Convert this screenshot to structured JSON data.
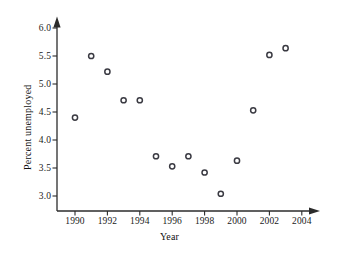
{
  "chart_data": {
    "type": "scatter",
    "title": "",
    "xlabel": "Year",
    "ylabel": "Percent unemployed",
    "x": [
      1990,
      1991,
      1992,
      1993,
      1994,
      1995,
      1996,
      1997,
      1998,
      1999,
      2000,
      2001,
      2002,
      2003
    ],
    "values": [
      4.4,
      5.5,
      5.22,
      4.71,
      4.71,
      3.71,
      3.53,
      3.71,
      3.42,
      3.04,
      3.63,
      4.53,
      5.52,
      5.64
    ],
    "series": [
      {
        "name": "Percent unemployed",
        "points": [
          {
            "x": 1990,
            "y": 4.4
          },
          {
            "x": 1991,
            "y": 5.5
          },
          {
            "x": 1992,
            "y": 5.22
          },
          {
            "x": 1993,
            "y": 4.71
          },
          {
            "x": 1994,
            "y": 4.71
          },
          {
            "x": 1995,
            "y": 3.71
          },
          {
            "x": 1996,
            "y": 3.53
          },
          {
            "x": 1997,
            "y": 3.71
          },
          {
            "x": 1998,
            "y": 3.42
          },
          {
            "x": 1999,
            "y": 3.04
          },
          {
            "x": 2000,
            "y": 3.63
          },
          {
            "x": 2001,
            "y": 4.53
          },
          {
            "x": 2002,
            "y": 5.52
          },
          {
            "x": 2003,
            "y": 5.64
          }
        ]
      }
    ],
    "xlim": [
      1988.6,
      2005.0
    ],
    "ylim": [
      2.7,
      6.15
    ],
    "xticks": [
      1990,
      1992,
      1994,
      1996,
      1998,
      2000,
      2002,
      2004
    ],
    "xtick_labels": [
      "1990",
      "1992",
      "1994",
      "1996",
      "1998",
      "2000",
      "2002",
      "2004"
    ],
    "yticks": [
      3.0,
      3.5,
      4.0,
      4.5,
      5.0,
      5.5,
      6.0
    ],
    "ytick_labels": [
      "3.0",
      "3.5",
      "4.0",
      "4.5",
      "5.0",
      "5.5",
      "6.0"
    ],
    "grid": false,
    "legend": null,
    "marker_style": "open-circle",
    "marker_color": "#3a3a42",
    "axis_color": "#2b2b2b",
    "background_color": "#ffffff"
  }
}
